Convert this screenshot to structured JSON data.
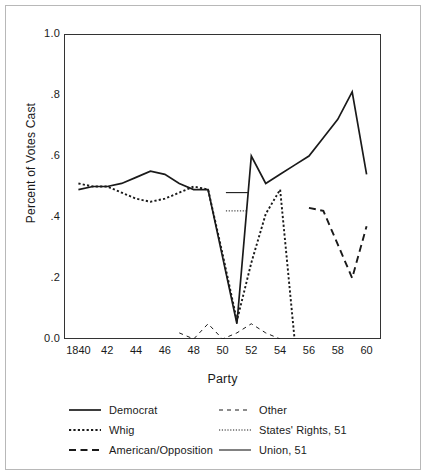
{
  "chart_data": {
    "type": "line",
    "title": "",
    "xlabel": "Party",
    "ylabel": "Percent of Votes Cast",
    "xlim": [
      1839,
      1861
    ],
    "ylim": [
      0.0,
      1.0
    ],
    "grid": false,
    "legend_position": "below-plot",
    "x_tick_labels": [
      "1840",
      "42",
      "44",
      "46",
      "48",
      "50",
      "52",
      "54",
      "56",
      "58",
      "60"
    ],
    "x_tick_values": [
      1840,
      1842,
      1844,
      1846,
      1848,
      1850,
      1852,
      1854,
      1856,
      1858,
      1860
    ],
    "y_tick_labels": [
      "0.0",
      ".2",
      ".4",
      ".6",
      ".8",
      "1.0"
    ],
    "y_tick_values": [
      0.0,
      0.2,
      0.4,
      0.6,
      0.8,
      1.0
    ],
    "series": [
      {
        "name": "Democrat",
        "style": "solid",
        "x": [
          1840,
          1841,
          1842,
          1843,
          1844,
          1845,
          1846,
          1847,
          1848,
          1849,
          1850,
          1851,
          1852,
          1853,
          1854,
          1855,
          1856,
          1857,
          1858,
          1859,
          1860
        ],
        "y": [
          0.49,
          0.5,
          0.5,
          0.51,
          0.53,
          0.55,
          0.54,
          0.51,
          0.49,
          0.49,
          0.27,
          0.05,
          0.6,
          0.51,
          0.54,
          0.57,
          0.6,
          0.66,
          0.72,
          0.81,
          0.54
        ]
      },
      {
        "name": "Whig",
        "style": "dotted",
        "x": [
          1840,
          1841,
          1842,
          1843,
          1844,
          1845,
          1846,
          1847,
          1848,
          1849,
          1850,
          1851,
          1852,
          1853,
          1854,
          1855
        ],
        "y": [
          0.51,
          0.5,
          0.5,
          0.48,
          0.46,
          0.45,
          0.46,
          0.48,
          0.5,
          0.49,
          0.28,
          0.06,
          0.25,
          0.41,
          0.49,
          0.0
        ]
      },
      {
        "name": "American/Opposition",
        "style": "dashed-long",
        "x": [
          1856,
          1857,
          1858,
          1859,
          1860
        ],
        "y": [
          0.43,
          0.42,
          0.31,
          0.2,
          0.37
        ]
      },
      {
        "name": "Other",
        "style": "dashed-short",
        "x": [
          1847,
          1848,
          1849,
          1850,
          1851,
          1852,
          1853,
          1854
        ],
        "y": [
          0.02,
          0.0,
          0.05,
          0.0,
          0.02,
          0.05,
          0.02,
          0.0
        ]
      },
      {
        "name": "States' Rights, 51",
        "style": "dotted-fine",
        "x": [
          1851
        ],
        "y": [
          0.42
        ],
        "marker_only": true
      },
      {
        "name": "Union, 51",
        "style": "solid-thin",
        "x": [
          1851
        ],
        "y": [
          0.48
        ],
        "marker_only": true
      }
    ]
  },
  "axes": {
    "y_title": "Percent of Votes Cast",
    "x_title": "Party"
  },
  "legend": {
    "entries": [
      {
        "label": "Democrat",
        "style": "solid"
      },
      {
        "label": "Other",
        "style": "dashed-short"
      },
      {
        "label": "Whig",
        "style": "dotted"
      },
      {
        "label": "States' Rights, 51",
        "style": "dotted-fine"
      },
      {
        "label": "American/Opposition",
        "style": "dashed-long"
      },
      {
        "label": "Union, 51",
        "style": "solid-thin"
      }
    ]
  },
  "colors": {
    "ink": "#1a1a1a",
    "axis": "#333333",
    "frame": "#b8b8b8",
    "background": "#ffffff"
  }
}
